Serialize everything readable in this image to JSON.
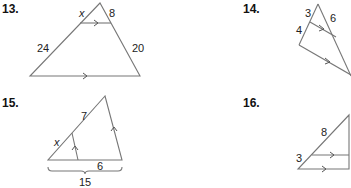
{
  "problems": [
    {
      "number": "13.",
      "labels": {
        "x": "x",
        "top_right": "8",
        "left": "24",
        "right": "20"
      }
    },
    {
      "number": "14.",
      "labels": {
        "top_left": "3",
        "left": "4",
        "top_right": "6"
      }
    },
    {
      "number": "15.",
      "labels": {
        "upper": "7",
        "lower": "x",
        "bottom_segment": "6",
        "total": "15"
      }
    },
    {
      "number": "16.",
      "labels": {
        "hyp": "8",
        "left": "3"
      }
    }
  ],
  "colors": {
    "line": "#777777",
    "text": "#222222"
  }
}
